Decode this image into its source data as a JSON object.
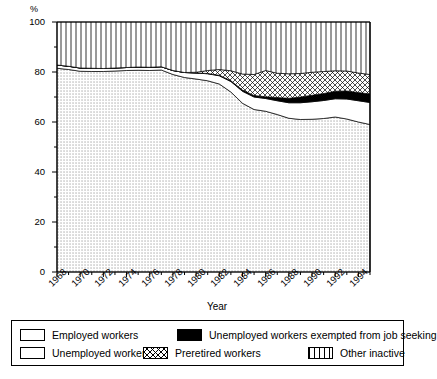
{
  "chart_data": {
    "type": "area",
    "stacked": true,
    "title": "",
    "xlabel": "Year",
    "ylabel": "%",
    "xlim": [
      1968,
      1995
    ],
    "ylim": [
      0,
      100
    ],
    "yticks": [
      0,
      20,
      40,
      60,
      80,
      100
    ],
    "yticks_minor": [
      10,
      30,
      50,
      70,
      90
    ],
    "xticks": [
      1968,
      1970,
      1972,
      1974,
      1976,
      1978,
      1980,
      1982,
      1984,
      1986,
      1988,
      1990,
      1992,
      1994
    ],
    "grid": false,
    "legend_position": "below-plot",
    "x": [
      1968,
      1969,
      1970,
      1971,
      1972,
      1973,
      1974,
      1975,
      1976,
      1977,
      1978,
      1979,
      1980,
      1981,
      1982,
      1983,
      1984,
      1985,
      1986,
      1987,
      1988,
      1989,
      1990,
      1991,
      1992,
      1993,
      1994,
      1995
    ],
    "series": [
      {
        "name": "Employed workers",
        "pattern": "dotted",
        "values": [
          81.5,
          81.0,
          80.3,
          80.2,
          80.2,
          80.4,
          80.6,
          80.7,
          80.6,
          80.8,
          79.0,
          77.8,
          77.2,
          76.5,
          75.2,
          72.0,
          67.5,
          65.0,
          64.3,
          63.0,
          61.5,
          61.0,
          61.1,
          61.4,
          62.0,
          61.2,
          60.0,
          59.0
        ]
      },
      {
        "name": "Unemployed workers",
        "pattern": "white",
        "values": [
          1.3,
          1.3,
          1.3,
          1.3,
          1.2,
          1.2,
          1.2,
          1.3,
          1.3,
          1.3,
          1.6,
          2.0,
          2.4,
          2.8,
          3.3,
          4.2,
          4.8,
          5.0,
          5.1,
          5.5,
          6.2,
          6.7,
          7.0,
          7.2,
          7.3,
          8.0,
          8.5,
          8.8
        ]
      },
      {
        "name": "Unemployed workers exempted from job seeking",
        "pattern": "black",
        "values": [
          0.0,
          0.0,
          0.0,
          0.0,
          0.0,
          0.0,
          0.0,
          0.0,
          0.0,
          0.0,
          0.0,
          0.0,
          0.0,
          0.1,
          0.2,
          0.3,
          0.5,
          0.6,
          0.7,
          1.3,
          1.8,
          2.3,
          2.6,
          2.8,
          3.0,
          3.2,
          3.3,
          3.4
        ]
      },
      {
        "name": "Preretired workers",
        "pattern": "crosshatch",
        "values": [
          0.0,
          0.0,
          0.0,
          0.0,
          0.0,
          0.0,
          0.0,
          0.0,
          0.0,
          0.0,
          0.0,
          0.0,
          0.3,
          1.2,
          2.3,
          4.0,
          6.4,
          8.4,
          10.5,
          9.7,
          9.8,
          9.4,
          9.2,
          8.8,
          8.2,
          8.0,
          7.8,
          7.8
        ]
      },
      {
        "name": "Other inactive",
        "pattern": "vertical-lines",
        "values": [
          17.2,
          17.7,
          18.4,
          18.5,
          18.6,
          18.4,
          18.2,
          18.0,
          18.1,
          17.9,
          19.4,
          20.2,
          20.1,
          19.4,
          19.0,
          19.5,
          20.8,
          21.0,
          19.4,
          20.5,
          20.7,
          20.6,
          20.1,
          19.8,
          19.5,
          19.6,
          20.4,
          21.0
        ]
      }
    ]
  },
  "axes": {
    "y_unit_label": "%",
    "y_tick_labels": [
      "100",
      "80",
      "60",
      "40",
      "20",
      "0"
    ],
    "x_tick_labels": [
      "1968",
      "1970",
      "1972",
      "1974",
      "1976",
      "1978",
      "1980",
      "1982",
      "1984",
      "1986",
      "1988",
      "1990",
      "1992",
      "1994"
    ],
    "x_axis_title": "Year"
  },
  "legend": {
    "items": [
      {
        "label": "Employed workers",
        "swatch": "dotted-swatch"
      },
      {
        "label": "Unemployed workers exempted from job seeking",
        "swatch": "black-swatch"
      },
      {
        "label": "Unemployed workers",
        "swatch": "white-swatch"
      },
      {
        "label": "Preretired workers",
        "swatch": "crosshatch-swatch"
      },
      {
        "label": "Other inactive",
        "swatch": "vertical-lines-swatch"
      }
    ]
  }
}
